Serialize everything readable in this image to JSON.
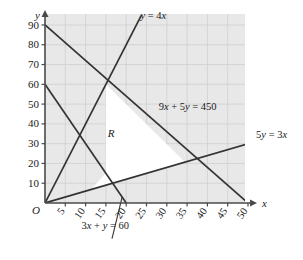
{
  "chart_data": {
    "type": "line",
    "title": "",
    "xlabel": "x",
    "ylabel": "y",
    "xlim": [
      0,
      50
    ],
    "ylim": [
      0,
      95
    ],
    "grid": true,
    "legend_position": "inline-annotations",
    "origin_label": "O",
    "region_label": "R",
    "background_color": "#e8e8e8",
    "region_fill_color": "#ffffff",
    "line_color": "#333333",
    "grid_color": "#cccccc",
    "xticks": [
      5,
      10,
      15,
      20,
      25,
      30,
      35,
      40,
      45,
      50
    ],
    "xtick_labels": [
      "5",
      "10",
      "15",
      "20",
      "25",
      "30",
      "35",
      "40",
      "45",
      "50"
    ],
    "yticks": [
      10,
      20,
      30,
      40,
      50,
      60,
      70,
      80,
      90
    ],
    "ytick_labels": [
      "10",
      "20",
      "30",
      "40",
      "50",
      "60",
      "70",
      "80",
      "90"
    ],
    "series": [
      {
        "name": "y = 4x",
        "label": "y = 4x",
        "equation": "y = 4x",
        "points": [
          [
            0,
            0
          ],
          [
            23.75,
            95
          ]
        ]
      },
      {
        "name": "9x + 5y = 450",
        "label": "9x + 5y = 450",
        "equation": "9x + 5y = 450",
        "points": [
          [
            0,
            90
          ],
          [
            50,
            0
          ]
        ]
      },
      {
        "name": "5y = 3x",
        "label": "5y = 3x",
        "equation": "5y = 3x",
        "points": [
          [
            0,
            0
          ],
          [
            51,
            30.6
          ]
        ]
      },
      {
        "name": "3x + y = 60",
        "label": "3x + y = 60",
        "equation": "3x + y = 60",
        "points": [
          [
            0,
            60
          ],
          [
            21,
            -3
          ]
        ]
      }
    ],
    "region": {
      "label": "R",
      "vertices": [
        [
          11.25,
          6.75
        ],
        [
          15,
          15
        ],
        [
          15,
          60
        ],
        [
          34.48,
          20.69
        ]
      ],
      "description": "feasible region bounded by y = 4x, 9x + 5y = 450, 5y = 3x and 3x + y = 60"
    },
    "annotations": [
      {
        "text": "y = 4x",
        "x": 23.5,
        "y": 93
      },
      {
        "text": "9x + 5y = 450",
        "x": 28,
        "y": 47
      },
      {
        "text": "5y = 3x",
        "x": 52,
        "y": 33
      },
      {
        "text": "3x + y = 60",
        "x": 9,
        "y": -13
      }
    ]
  },
  "figure": {
    "axis_x_name": "x",
    "axis_y_name": "y"
  }
}
